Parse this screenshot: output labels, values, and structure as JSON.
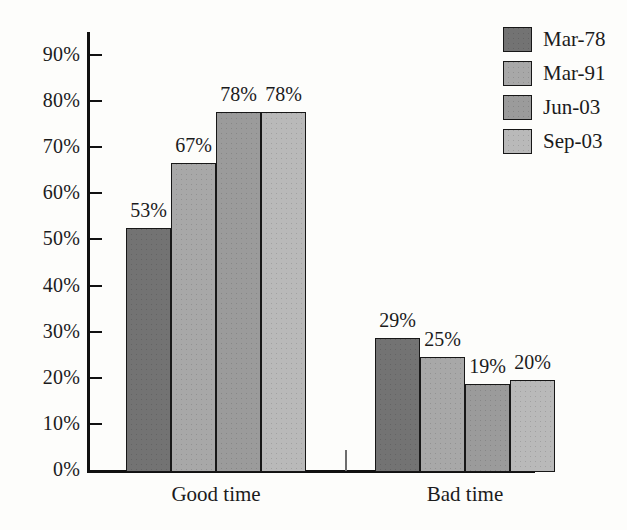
{
  "chart_data": {
    "type": "bar",
    "title": "",
    "subtitle": "",
    "xlabel": "",
    "ylabel": "",
    "ylim": [
      0,
      95
    ],
    "grid": false,
    "legend_position": "top-right",
    "categories": [
      "Good time",
      "Bad time"
    ],
    "ytick_labels": [
      "0%",
      "10%",
      "20%",
      "30%",
      "40%",
      "50%",
      "60%",
      "70%",
      "80%",
      "90%"
    ],
    "ytick_values": [
      0,
      10,
      20,
      30,
      40,
      50,
      60,
      70,
      80,
      90
    ],
    "series": [
      {
        "name": "Mar-78",
        "color": "#737373",
        "values": [
          53,
          29
        ],
        "labels": [
          "53%",
          "29%"
        ]
      },
      {
        "name": "Mar-91",
        "color": "#a8a8a8",
        "values": [
          67,
          25
        ],
        "labels": [
          "67%",
          "25%"
        ]
      },
      {
        "name": "Jun-03",
        "color": "#9b9b9b",
        "values": [
          78,
          19
        ],
        "labels": [
          "78%",
          "19%"
        ]
      },
      {
        "name": "Sep-03",
        "color": "#b9b9b9",
        "values": [
          78,
          20
        ],
        "labels": [
          "78%",
          "20%"
        ]
      }
    ]
  }
}
